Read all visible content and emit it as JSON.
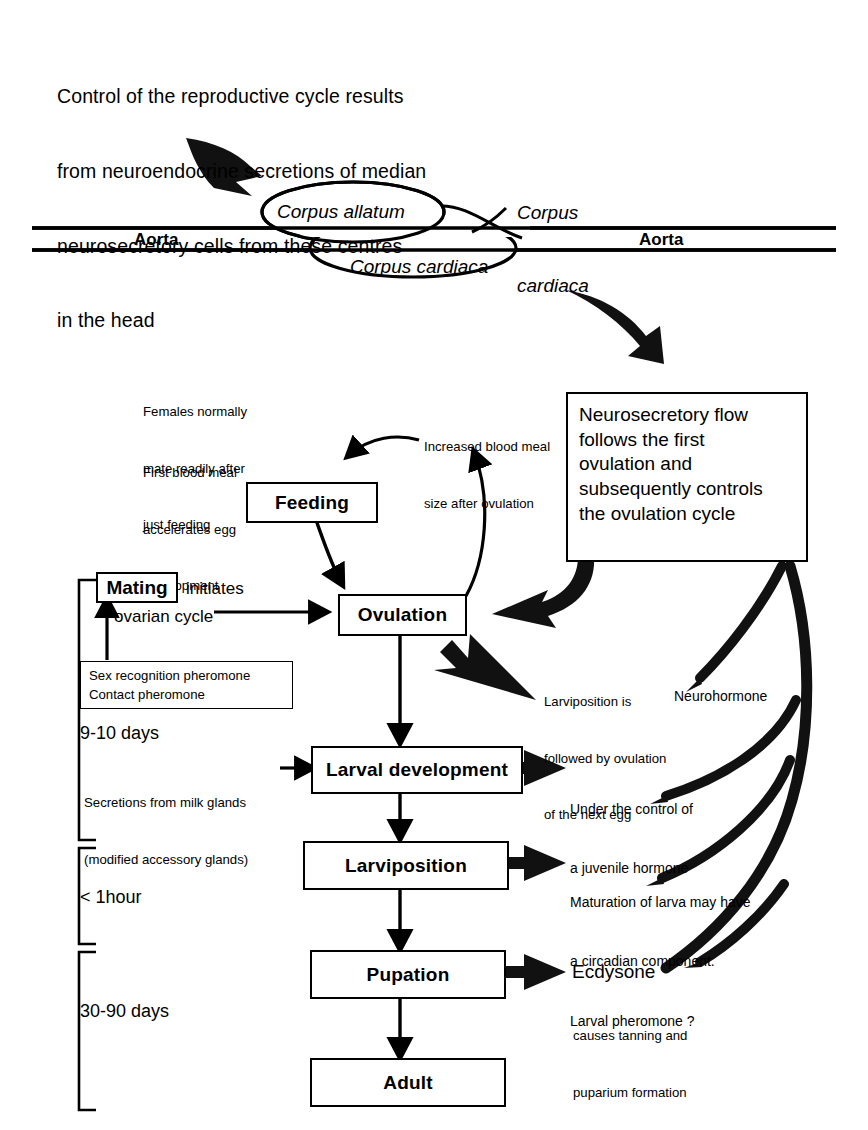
{
  "diagram": {
    "title_note": "Control of the reproductive cycle results from neuroendocrine secretions of median neurosecretory cells from these centres in the head",
    "intro_lines": [
      "Control of the reproductive cycle results",
      "from neuroendocrine secretions of median",
      "neurosecretory cells from these centres",
      "in the head"
    ]
  },
  "anatomy": {
    "corpus_allatum": "Corpus allatum",
    "corpus_cardiaca_lower": "Corpus cardiaca",
    "corpus_cardiaca_label_lines": [
      "Corpus",
      "cardiaca"
    ],
    "aorta_left": "Aorta",
    "aorta_right": "Aorta"
  },
  "nodes": {
    "feeding": "Feeding",
    "ovulation": "Ovulation",
    "mating": "Mating",
    "larval_development": "Larval development",
    "larviposition": "Larviposition",
    "pupation": "Pupation",
    "adult": "Adult"
  },
  "notes": {
    "females_mate_lines": [
      "Females normally",
      "mate readily after",
      "just feeding"
    ],
    "first_blood_meal_lines": [
      "First blood meal",
      "accelerates egg",
      "development"
    ],
    "increased_blood_meal_lines": [
      "Increased blood meal",
      "size after ovulation"
    ],
    "mating_initiates_lines": [
      "initiates",
      "ovarian cycle"
    ],
    "mating_initiates_word": "initiates",
    "mating_ovarian_word": "ovarian cycle",
    "pheromone_lines": [
      "Sex recognition pheromone",
      "Contact pheromone"
    ],
    "milk_glands_lines": [
      "Secretions from milk glands",
      "(modified accessory glands)"
    ],
    "larviposition_followed_lines": [
      "Larviposition is",
      "followed by ovulation",
      "of the next egg"
    ],
    "juvenile_hormone_lines": [
      "Under the control of",
      "a juvenile hormone"
    ],
    "maturation_lines": [
      "Maturation of larva may have",
      "a circadian component.",
      "Larval pheromone ?"
    ],
    "neurohormone": "Neurohormone",
    "ecdysone": "Ecdysone",
    "ecdysone_sub_lines": [
      "causes tanning and",
      "puparium formation"
    ]
  },
  "big_box": {
    "lines": [
      "Neurosecretory flow",
      "follows the first",
      "ovulation and",
      "subsequently controls",
      "the ovulation cycle"
    ]
  },
  "brackets": [
    {
      "label": "9-10 days"
    },
    {
      "label": "< 1hour"
    },
    {
      "label": "30-90 days"
    }
  ],
  "colors": {
    "ink": "#000000",
    "paper": "#ffffff"
  }
}
